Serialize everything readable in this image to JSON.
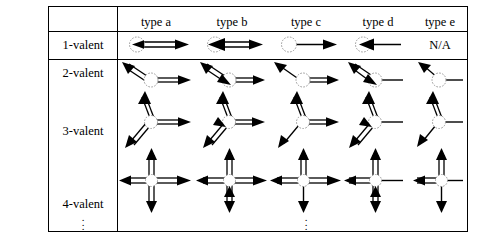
{
  "figure": {
    "type": "diagram-table",
    "title": ""
  },
  "table": {
    "corner_label": "",
    "column_headers": [
      {
        "id": "type-a",
        "label": "type a"
      },
      {
        "id": "type-b",
        "label": "type b"
      },
      {
        "id": "type-c",
        "label": "type c"
      },
      {
        "id": "type-d",
        "label": "type d"
      },
      {
        "id": "type-e",
        "label": "type e"
      }
    ],
    "row_headers": [
      {
        "id": "row-1valent",
        "label": "1-valent"
      },
      {
        "id": "row-2valent",
        "label": "2-valent"
      },
      {
        "id": "row-3valent",
        "label": "3-valent"
      },
      {
        "id": "row-4valent",
        "label": "4-valent"
      }
    ],
    "row_continuation": "⋮",
    "column_continuation": "⋮",
    "na_text": "N/A",
    "na_cell": {
      "row": "1-valent",
      "column": "type e"
    }
  },
  "cells": [
    {
      "row": "1-valent",
      "column": "type a",
      "edges": [
        {
          "direction": "right",
          "style": "double",
          "arrow_out": true,
          "arrow_in": true
        }
      ]
    },
    {
      "row": "1-valent",
      "column": "type b",
      "edges": [
        {
          "direction": "right",
          "style": "double",
          "arrow_out": true,
          "arrow_in": true,
          "arrow_in_bold": true
        }
      ]
    },
    {
      "row": "1-valent",
      "column": "type c",
      "edges": [
        {
          "direction": "right",
          "style": "single",
          "arrow_out": true,
          "arrow_in": false
        }
      ]
    },
    {
      "row": "1-valent",
      "column": "type d",
      "edges": [
        {
          "direction": "right",
          "style": "single",
          "arrow_out": false,
          "arrow_in": true
        }
      ]
    },
    {
      "row": "1-valent",
      "column": "type e",
      "edges": [],
      "text": "N/A"
    },
    {
      "row": "2-valent",
      "column": "type a",
      "edges": [
        {
          "direction": "upleft",
          "style": "double",
          "arrow_out": true,
          "arrow_in": false
        },
        {
          "direction": "right",
          "style": "double",
          "arrow_out": true,
          "arrow_in": false
        }
      ]
    },
    {
      "row": "2-valent",
      "column": "type b",
      "edges": [
        {
          "direction": "upleft",
          "style": "double",
          "arrow_out": true,
          "arrow_in": true
        },
        {
          "direction": "right",
          "style": "double",
          "arrow_out": true,
          "arrow_in": false
        }
      ]
    },
    {
      "row": "2-valent",
      "column": "type c",
      "edges": [
        {
          "direction": "upleft",
          "style": "single",
          "arrow_out": true,
          "arrow_in": false
        },
        {
          "direction": "right",
          "style": "double",
          "arrow_out": true,
          "arrow_in": false
        }
      ]
    },
    {
      "row": "2-valent",
      "column": "type d",
      "edges": [
        {
          "direction": "upleft",
          "style": "double",
          "arrow_out": true,
          "arrow_in": true
        },
        {
          "direction": "right",
          "style": "single",
          "arrow_out": false,
          "arrow_in": false
        }
      ]
    },
    {
      "row": "2-valent",
      "column": "type e",
      "edges": [
        {
          "direction": "upleft",
          "style": "single",
          "arrow_out": true,
          "arrow_in": false
        },
        {
          "direction": "right",
          "style": "single",
          "arrow_out": false,
          "arrow_in": false
        }
      ]
    },
    {
      "row": "3-valent",
      "column": "type a",
      "edges": [
        {
          "direction": "up",
          "style": "double",
          "arrow_out": true,
          "arrow_in": false
        },
        {
          "direction": "downleft",
          "style": "double",
          "arrow_out": true,
          "arrow_in": false
        },
        {
          "direction": "right",
          "style": "double",
          "arrow_out": true,
          "arrow_in": false
        }
      ]
    },
    {
      "row": "3-valent",
      "column": "type b",
      "edges": [
        {
          "direction": "up",
          "style": "double",
          "arrow_out": true,
          "arrow_in": false
        },
        {
          "direction": "downleft",
          "style": "double",
          "arrow_out": true,
          "arrow_in": true
        },
        {
          "direction": "right",
          "style": "double",
          "arrow_out": true,
          "arrow_in": false
        }
      ]
    },
    {
      "row": "3-valent",
      "column": "type c",
      "edges": [
        {
          "direction": "up",
          "style": "double",
          "arrow_out": true,
          "arrow_in": false
        },
        {
          "direction": "downleft",
          "style": "single",
          "arrow_out": true,
          "arrow_in": false
        },
        {
          "direction": "right",
          "style": "double",
          "arrow_out": true,
          "arrow_in": false
        }
      ]
    },
    {
      "row": "3-valent",
      "column": "type d",
      "edges": [
        {
          "direction": "up",
          "style": "double",
          "arrow_out": true,
          "arrow_in": false
        },
        {
          "direction": "downleft",
          "style": "double",
          "arrow_out": true,
          "arrow_in": true
        },
        {
          "direction": "right",
          "style": "single",
          "arrow_out": false,
          "arrow_in": false
        }
      ]
    },
    {
      "row": "3-valent",
      "column": "type e",
      "edges": [
        {
          "direction": "up",
          "style": "double",
          "arrow_out": true,
          "arrow_in": false
        },
        {
          "direction": "downleft",
          "style": "single",
          "arrow_out": true,
          "arrow_in": false
        },
        {
          "direction": "right",
          "style": "single",
          "arrow_out": false,
          "arrow_in": false
        }
      ]
    },
    {
      "row": "4-valent",
      "column": "type a",
      "edges": [
        {
          "direction": "up",
          "style": "double",
          "arrow_out": true,
          "arrow_in": false
        },
        {
          "direction": "down",
          "style": "double",
          "arrow_out": true,
          "arrow_in": false
        },
        {
          "direction": "left",
          "style": "double",
          "arrow_out": true,
          "arrow_in": false
        },
        {
          "direction": "right",
          "style": "double",
          "arrow_out": true,
          "arrow_in": false
        }
      ]
    },
    {
      "row": "4-valent",
      "column": "type b",
      "edges": [
        {
          "direction": "up",
          "style": "double",
          "arrow_out": true,
          "arrow_in": false
        },
        {
          "direction": "down",
          "style": "double",
          "arrow_out": true,
          "arrow_in": true
        },
        {
          "direction": "left",
          "style": "double",
          "arrow_out": true,
          "arrow_in": false
        },
        {
          "direction": "right",
          "style": "double",
          "arrow_out": true,
          "arrow_in": false
        }
      ]
    },
    {
      "row": "4-valent",
      "column": "type c",
      "edges": [
        {
          "direction": "up",
          "style": "double",
          "arrow_out": true,
          "arrow_in": false
        },
        {
          "direction": "down",
          "style": "single",
          "arrow_out": true,
          "arrow_in": false
        },
        {
          "direction": "left",
          "style": "double",
          "arrow_out": true,
          "arrow_in": false
        },
        {
          "direction": "right",
          "style": "double",
          "arrow_out": true,
          "arrow_in": false
        }
      ]
    },
    {
      "row": "4-valent",
      "column": "type d",
      "edges": [
        {
          "direction": "up",
          "style": "double",
          "arrow_out": true,
          "arrow_in": false
        },
        {
          "direction": "down",
          "style": "double",
          "arrow_out": true,
          "arrow_in": true
        },
        {
          "direction": "left",
          "style": "double",
          "arrow_out": true,
          "arrow_in": false
        },
        {
          "direction": "right",
          "style": "single",
          "arrow_out": false,
          "arrow_in": false
        }
      ]
    },
    {
      "row": "4-valent",
      "column": "type e",
      "edges": [
        {
          "direction": "up",
          "style": "double",
          "arrow_out": true,
          "arrow_in": false
        },
        {
          "direction": "down",
          "style": "single",
          "arrow_out": true,
          "arrow_in": false
        },
        {
          "direction": "left",
          "style": "double",
          "arrow_out": true,
          "arrow_in": false
        },
        {
          "direction": "right",
          "style": "single",
          "arrow_out": false,
          "arrow_in": false
        }
      ]
    }
  ],
  "style": {
    "line_color": "#000000",
    "vertex_circle_color": "#9a9a9a",
    "background": "#ffffff"
  }
}
